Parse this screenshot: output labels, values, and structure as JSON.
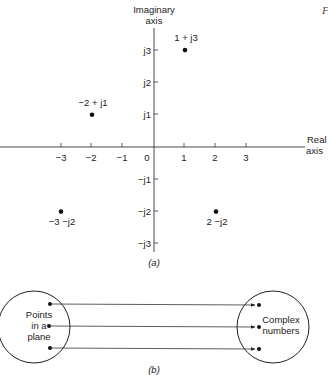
{
  "corner_mark": "F",
  "part_a": {
    "caption": "(a)",
    "imag_axis_label": [
      "Imaginary",
      "axis"
    ],
    "real_axis_label": [
      "Real",
      "axis"
    ],
    "real_ticks": [
      {
        "label": "−3",
        "x": 61
      },
      {
        "label": "−2",
        "x": 91
      },
      {
        "label": "−1",
        "x": 122
      },
      {
        "label": "1",
        "x": 184
      },
      {
        "label": "2",
        "x": 215
      },
      {
        "label": "3",
        "x": 246
      }
    ],
    "origin_label": "0",
    "imag_ticks": [
      {
        "label": "j3",
        "y": 50
      },
      {
        "label": "j2",
        "y": 82
      },
      {
        "label": "j1",
        "y": 114
      },
      {
        "label": "−j1",
        "y": 179
      },
      {
        "label": "−j2",
        "y": 211
      },
      {
        "label": "−j3",
        "y": 243
      }
    ],
    "points": [
      {
        "label": "1 + j3",
        "re": 1,
        "im": 3
      },
      {
        "label": "−2 + j1",
        "re": -2,
        "im": 1
      },
      {
        "label": "−3 −j2",
        "re": -3,
        "im": -2
      },
      {
        "label": "2 −j2",
        "re": 2,
        "im": -2
      }
    ]
  },
  "part_b": {
    "caption": "(b)",
    "left_set_label": [
      "Points",
      "in a",
      "plane"
    ],
    "right_set_label": [
      "Complex",
      "numbers"
    ],
    "mappings": 3
  },
  "chart_data": {
    "type": "scatter",
    "xlabel": "Real axis",
    "ylabel": "Imaginary axis",
    "x_ticks": [
      -3,
      -2,
      -1,
      0,
      1,
      2,
      3
    ],
    "y_ticks": [
      "-j3",
      "-j2",
      "-j1",
      "j1",
      "j2",
      "j3"
    ],
    "xlim": [
      -5,
      4
    ],
    "ylim": [
      -3,
      3.5
    ],
    "points": [
      {
        "x": 1,
        "y": 3,
        "label": "1 + j3"
      },
      {
        "x": -2,
        "y": 1,
        "label": "-2 + j1"
      },
      {
        "x": -3,
        "y": -2,
        "label": "-3 - j2"
      },
      {
        "x": 2,
        "y": -2,
        "label": "2 - j2"
      }
    ],
    "grid": false
  }
}
